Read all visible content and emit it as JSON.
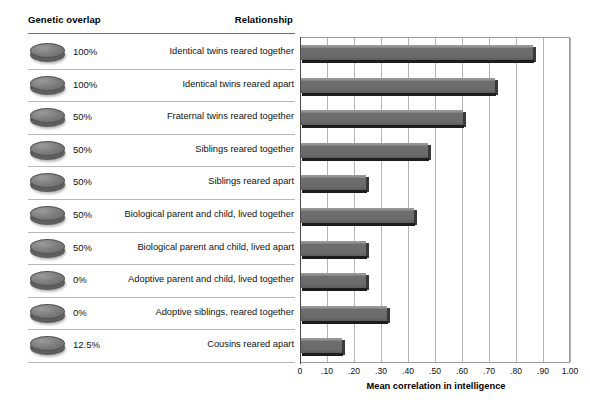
{
  "table": {
    "headers": {
      "genetic_overlap": "Genetic overlap",
      "relationship": "Relationship"
    }
  },
  "chart_data": {
    "type": "bar",
    "orientation": "horizontal",
    "title": "",
    "xlabel": "Mean correlation in intelligence",
    "ylabel": "",
    "xlim": [
      0,
      1.0
    ],
    "grid": true,
    "legend": "none",
    "tick_labels": [
      "0",
      ".10",
      ".20",
      ".30",
      ".40",
      ".50",
      ".60",
      ".70",
      ".80",
      ".90",
      "1.00"
    ],
    "tick_values": [
      0,
      0.1,
      0.2,
      0.3,
      0.4,
      0.5,
      0.6,
      0.7,
      0.8,
      0.9,
      1.0
    ],
    "categories": [
      "Identical twins reared together",
      "Identical twins reared apart",
      "Fraternal twins reared together",
      "Siblings reared together",
      "Siblings reared apart",
      "Biological parent and child, lived together",
      "Biological parent and child, lived apart",
      "Adoptive parent and child, lived together",
      "Adoptive siblings, reared together",
      "Cousins reared apart"
    ],
    "values": [
      0.86,
      0.72,
      0.6,
      0.47,
      0.24,
      0.42,
      0.24,
      0.24,
      0.32,
      0.15
    ],
    "genetic_overlap": [
      "100%",
      "100%",
      "50%",
      "50%",
      "50%",
      "50%",
      "50%",
      "0%",
      "0%",
      "12.5%"
    ],
    "bar_color": "#6b6b6b",
    "grid_color": "#b4b4b4",
    "axis_color": "#4a4a4a"
  },
  "rows": [
    {
      "overlap": "100%",
      "relationship": "Identical twins reared together",
      "value": 0.86
    },
    {
      "overlap": "100%",
      "relationship": "Identical twins reared apart",
      "value": 0.72
    },
    {
      "overlap": "50%",
      "relationship": "Fraternal twins reared together",
      "value": 0.6
    },
    {
      "overlap": "50%",
      "relationship": "Siblings reared together",
      "value": 0.47
    },
    {
      "overlap": "50%",
      "relationship": "Siblings reared apart",
      "value": 0.24
    },
    {
      "overlap": "50%",
      "relationship": "Biological parent and child, lived together",
      "value": 0.42
    },
    {
      "overlap": "50%",
      "relationship": "Biological parent and child, lived apart",
      "value": 0.24
    },
    {
      "overlap": "0%",
      "relationship": "Adoptive parent and child, lived together",
      "value": 0.24
    },
    {
      "overlap": "0%",
      "relationship": "Adoptive siblings, reared together",
      "value": 0.32
    },
    {
      "overlap": "12.5%",
      "relationship": "Cousins reared apart",
      "value": 0.15
    }
  ],
  "axis": {
    "title": "Mean correlation in intelligence"
  }
}
